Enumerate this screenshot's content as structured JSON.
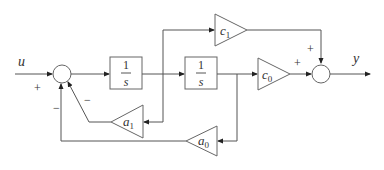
{
  "diagram": {
    "type": "block-diagram",
    "input_label": "u",
    "output_label": "y",
    "blocks": [
      {
        "id": "int1",
        "kind": "integrator",
        "num": "1",
        "den": "s"
      },
      {
        "id": "int2",
        "kind": "integrator",
        "num": "1",
        "den": "s"
      },
      {
        "id": "c1",
        "kind": "gain",
        "label": "c",
        "sub": "1"
      },
      {
        "id": "c0",
        "kind": "gain",
        "label": "c",
        "sub": "0"
      },
      {
        "id": "a1",
        "kind": "gain",
        "label": "a",
        "sub": "1"
      },
      {
        "id": "a0",
        "kind": "gain",
        "label": "a",
        "sub": "0"
      }
    ],
    "junction1_signs": {
      "input": "+",
      "a1": "−",
      "a0": "−"
    },
    "junction2_signs": {
      "c1": "+",
      "c0": "+"
    }
  }
}
